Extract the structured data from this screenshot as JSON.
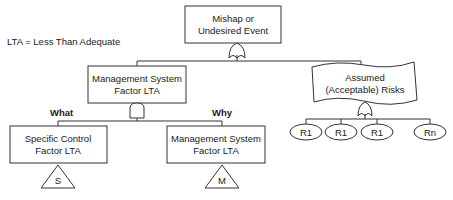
{
  "legend": {
    "text": "LTA = Less Than Adequate"
  },
  "nodes": {
    "top_event": {
      "line1": "Mishap or",
      "line2": "Undesired Event"
    },
    "mgmt_system": {
      "line1": "Management System",
      "line2": "Factor LTA"
    },
    "assumed_risks": {
      "line1": "Assumed",
      "line2": "(Acceptable) Risks"
    },
    "specific_control": {
      "line1": "Specific Control",
      "line2": "Factor LTA"
    },
    "mgmt_system_why": {
      "line1": "Management System",
      "line2": "Factor LTA"
    }
  },
  "branch_labels": {
    "what": "What",
    "why": "Why"
  },
  "transfers": {
    "s": "S",
    "m": "M"
  },
  "risks": [
    "R1",
    "R1",
    "R1",
    "Rn"
  ],
  "gates": {
    "top": "or-gate",
    "mgmt": "and-gate",
    "risks": "or-gate"
  },
  "colors": {
    "stroke": "#333333",
    "text": "#222222",
    "background": "#ffffff"
  }
}
